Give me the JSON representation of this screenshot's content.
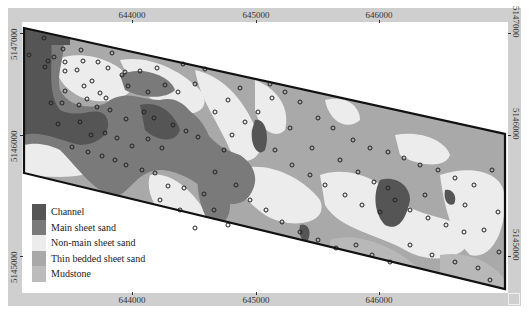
{
  "map": {
    "title": "",
    "axes": {
      "x_ticks": [
        {
          "label": "644000",
          "px": 132
        },
        {
          "label": "645000",
          "px": 256
        },
        {
          "label": "646000",
          "px": 379
        }
      ],
      "y_ticks": [
        {
          "label": "5147000",
          "py": 33
        },
        {
          "label": "5146000",
          "py": 135
        },
        {
          "label": "5145000",
          "py": 256
        }
      ]
    },
    "polygon_outline": [
      [
        24,
        28
      ],
      [
        505,
        134
      ],
      [
        505,
        289
      ],
      [
        24,
        173
      ]
    ],
    "legend": {
      "items": [
        {
          "label": "Channel",
          "color": "#555555"
        },
        {
          "label": "Main sheet sand",
          "color": "#7a7a7a"
        },
        {
          "label": "Non-main sheet sand",
          "color": "#ececec"
        },
        {
          "label": "Thin bedded sheet sand",
          "color": "#a9a9a9"
        },
        {
          "label": "Mudstone",
          "color": "#bcbcbc"
        }
      ]
    },
    "colors": {
      "frame": "#cfcfcf",
      "outline": "#111111",
      "well_marker": "#222222"
    },
    "caption": ""
  }
}
